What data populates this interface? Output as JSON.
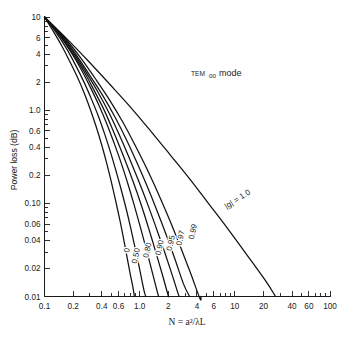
{
  "chart_data": {
    "type": "line",
    "title": "",
    "xlabel": "N = a²/λL",
    "ylabel": "Power loss (dB)",
    "xscale": "log",
    "yscale": "log",
    "xlim": [
      0.1,
      100
    ],
    "ylim": [
      0.01,
      10
    ],
    "grid": false,
    "legend_position": "inline-curve-labels",
    "xticks": [
      "0.1",
      "0.2",
      "0.4",
      "0.6",
      "1.0",
      "2",
      "4",
      "6",
      "10",
      "20",
      "40",
      "60",
      "100"
    ],
    "xtick_values": [
      0.1,
      0.2,
      0.4,
      0.6,
      1.0,
      2,
      4,
      6,
      10,
      20,
      40,
      60,
      100
    ],
    "yticks": [
      "10",
      "6",
      "4",
      "2",
      "1.0",
      "0.6",
      "0.4",
      "0.2",
      "0.10",
      "0.06",
      "0.04",
      "0.02",
      "0.01"
    ],
    "ytick_values": [
      10,
      6,
      4,
      2,
      1.0,
      0.6,
      0.4,
      0.2,
      0.1,
      0.06,
      0.04,
      0.02,
      0.01
    ],
    "annotations": [
      {
        "name": "mode-annotation",
        "text_small": "TEM",
        "text_sub": "00",
        "text_main": "mode",
        "x": 2.6,
        "y": 2.8
      },
      {
        "name": "g-parameter-annotation",
        "text": "|g| = 1.0",
        "x": 11.0,
        "y": 0.105
      }
    ],
    "series": [
      {
        "name": "0",
        "label": "0",
        "g": 0,
        "label_x": 0.78,
        "label_y": 0.031,
        "points": [
          [
            0.1,
            10
          ],
          [
            0.12,
            7.4
          ],
          [
            0.15,
            5.0
          ],
          [
            0.18,
            3.5
          ],
          [
            0.22,
            2.3
          ],
          [
            0.26,
            1.55
          ],
          [
            0.3,
            1.05
          ],
          [
            0.35,
            0.66
          ],
          [
            0.4,
            0.42
          ],
          [
            0.45,
            0.27
          ],
          [
            0.5,
            0.175
          ],
          [
            0.55,
            0.115
          ],
          [
            0.6,
            0.077
          ],
          [
            0.65,
            0.052
          ],
          [
            0.7,
            0.035
          ],
          [
            0.75,
            0.024
          ],
          [
            0.8,
            0.017
          ],
          [
            0.85,
            0.0125
          ],
          [
            0.88,
            0.01
          ]
        ]
      },
      {
        "name": "0.50",
        "label": "0.50",
        "g": 0.5,
        "label_x": 0.97,
        "label_y": 0.027,
        "points": [
          [
            0.1,
            10
          ],
          [
            0.13,
            7.0
          ],
          [
            0.17,
            4.6
          ],
          [
            0.21,
            3.1
          ],
          [
            0.26,
            2.0
          ],
          [
            0.31,
            1.33
          ],
          [
            0.37,
            0.85
          ],
          [
            0.43,
            0.55
          ],
          [
            0.5,
            0.34
          ],
          [
            0.57,
            0.215
          ],
          [
            0.64,
            0.14
          ],
          [
            0.72,
            0.088
          ],
          [
            0.8,
            0.056
          ],
          [
            0.88,
            0.036
          ],
          [
            0.96,
            0.024
          ],
          [
            1.04,
            0.016
          ],
          [
            1.12,
            0.0112
          ],
          [
            1.16,
            0.01
          ]
        ]
      },
      {
        "name": "0.80",
        "label": "0.80",
        "g": 0.8,
        "label_x": 1.28,
        "label_y": 0.031,
        "points": [
          [
            0.1,
            10
          ],
          [
            0.14,
            6.6
          ],
          [
            0.19,
            4.2
          ],
          [
            0.24,
            2.8
          ],
          [
            0.3,
            1.8
          ],
          [
            0.37,
            1.15
          ],
          [
            0.45,
            0.72
          ],
          [
            0.54,
            0.44
          ],
          [
            0.64,
            0.27
          ],
          [
            0.75,
            0.163
          ],
          [
            0.87,
            0.098
          ],
          [
            1.0,
            0.059
          ],
          [
            1.14,
            0.036
          ],
          [
            1.28,
            0.023
          ],
          [
            1.42,
            0.0152
          ],
          [
            1.56,
            0.0105
          ],
          [
            1.6,
            0.01
          ]
        ]
      },
      {
        "name": "0.90",
        "label": "0.90",
        "g": 0.9,
        "label_x": 1.72,
        "label_y": 0.033,
        "points": [
          [
            0.1,
            10
          ],
          [
            0.145,
            6.4
          ],
          [
            0.2,
            4.0
          ],
          [
            0.26,
            2.6
          ],
          [
            0.33,
            1.65
          ],
          [
            0.42,
            1.02
          ],
          [
            0.52,
            0.62
          ],
          [
            0.64,
            0.37
          ],
          [
            0.78,
            0.22
          ],
          [
            0.94,
            0.13
          ],
          [
            1.12,
            0.076
          ],
          [
            1.32,
            0.044
          ],
          [
            1.54,
            0.026
          ],
          [
            1.76,
            0.0162
          ],
          [
            1.98,
            0.0105
          ],
          [
            2.02,
            0.01
          ]
        ]
      },
      {
        "name": "0.95",
        "label": "0.95",
        "g": 0.95,
        "label_x": 2.25,
        "label_y": 0.037,
        "points": [
          [
            0.1,
            10
          ],
          [
            0.15,
            6.3
          ],
          [
            0.21,
            3.9
          ],
          [
            0.28,
            2.45
          ],
          [
            0.37,
            1.52
          ],
          [
            0.48,
            0.92
          ],
          [
            0.61,
            0.545
          ],
          [
            0.77,
            0.315
          ],
          [
            0.96,
            0.181
          ],
          [
            1.19,
            0.103
          ],
          [
            1.46,
            0.058
          ],
          [
            1.78,
            0.0325
          ],
          [
            2.14,
            0.0185
          ],
          [
            2.5,
            0.0112
          ],
          [
            2.6,
            0.01
          ]
        ]
      },
      {
        "name": "0.97",
        "label": "0.97",
        "g": 0.97,
        "label_x": 2.85,
        "label_y": 0.042,
        "points": [
          [
            0.1,
            10
          ],
          [
            0.155,
            6.2
          ],
          [
            0.22,
            3.8
          ],
          [
            0.3,
            2.35
          ],
          [
            0.41,
            1.43
          ],
          [
            0.55,
            0.845
          ],
          [
            0.72,
            0.49
          ],
          [
            0.93,
            0.277
          ],
          [
            1.19,
            0.155
          ],
          [
            1.51,
            0.085
          ],
          [
            1.9,
            0.046
          ],
          [
            2.36,
            0.0248
          ],
          [
            2.9,
            0.0135
          ],
          [
            3.35,
            0.01
          ]
        ]
      },
      {
        "name": "0.99",
        "label": "0.99",
        "g": 0.99,
        "label_x": 3.85,
        "label_y": 0.049,
        "points": [
          [
            0.1,
            10
          ],
          [
            0.16,
            6.1
          ],
          [
            0.24,
            3.65
          ],
          [
            0.34,
            2.2
          ],
          [
            0.48,
            1.3
          ],
          [
            0.66,
            0.755
          ],
          [
            0.89,
            0.425
          ],
          [
            1.19,
            0.235
          ],
          [
            1.57,
            0.127
          ],
          [
            2.05,
            0.0675
          ],
          [
            2.65,
            0.0352
          ],
          [
            3.4,
            0.0182
          ],
          [
            4.3,
            0.0095
          ],
          [
            4.4,
            0.01
          ]
        ]
      },
      {
        "name": "1.0",
        "label": "|g| = 1.0",
        "g": 1.0,
        "label_x": 11.0,
        "label_y": 0.105,
        "points": [
          [
            0.1,
            10
          ],
          [
            0.17,
            5.9
          ],
          [
            0.29,
            3.35
          ],
          [
            0.48,
            1.92
          ],
          [
            0.8,
            1.08
          ],
          [
            1.3,
            0.6
          ],
          [
            2.1,
            0.33
          ],
          [
            3.4,
            0.18
          ],
          [
            5.4,
            0.097
          ],
          [
            8.6,
            0.052
          ],
          [
            13.5,
            0.0277
          ],
          [
            21,
            0.0148
          ],
          [
            26,
            0.0105
          ],
          [
            26.5,
            0.01
          ]
        ]
      }
    ]
  }
}
